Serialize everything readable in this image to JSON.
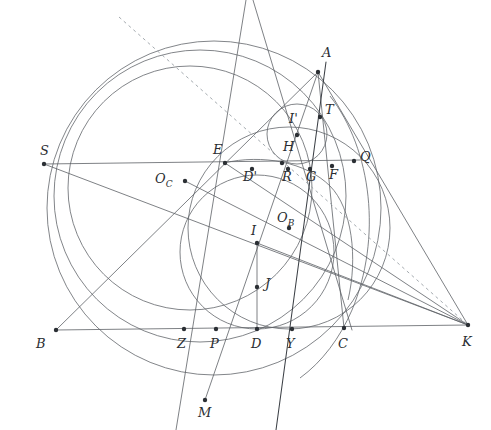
{
  "figure": {
    "width": 491,
    "height": 430,
    "background": "#ffffff",
    "stroke_color": "#62666b",
    "accent_stroke": "#3c4046",
    "dashed_color": "#9aa0a6",
    "label_color": "#2a2d31"
  },
  "points": [
    {
      "id": "A",
      "label": "A",
      "x": 318,
      "y": 72,
      "lx": 322,
      "ly": 48,
      "dot": true
    },
    {
      "id": "B",
      "label": "B",
      "x": 56,
      "y": 330,
      "lx": 37,
      "ly": 339,
      "dot": true
    },
    {
      "id": "C",
      "label": "C",
      "x": 344,
      "y": 328,
      "lx": 338,
      "ly": 339,
      "dot": true
    },
    {
      "id": "K",
      "label": "K",
      "x": 468,
      "y": 325,
      "lx": 462,
      "ly": 338,
      "dot": true
    },
    {
      "id": "S",
      "label": "S",
      "x": 44,
      "y": 164,
      "lx": 40,
      "ly": 146,
      "dot": true
    },
    {
      "id": "E",
      "label": "E",
      "x": 225,
      "y": 163,
      "lx": 215,
      "ly": 145,
      "dot": true
    },
    {
      "id": "Q",
      "label": "Q",
      "x": 354,
      "y": 161,
      "lx": 359,
      "ly": 152,
      "dot": true
    },
    {
      "id": "T",
      "label": "T",
      "x": 320,
      "y": 117,
      "lx": 326,
      "ly": 105,
      "dot": true
    },
    {
      "id": "Iprime",
      "label": "I'",
      "x": 297,
      "y": 135,
      "lx": 290,
      "ly": 114,
      "dot": true
    },
    {
      "id": "H",
      "label": "H",
      "x": 282,
      "y": 163,
      "lx": 284,
      "ly": 143,
      "dot": true
    },
    {
      "id": "Dprime",
      "label": "D'",
      "x": 252,
      "y": 170,
      "lx": 246,
      "ly": 172,
      "dot": true
    },
    {
      "id": "R",
      "label": "R",
      "x": 288,
      "y": 170,
      "lx": 283,
      "ly": 172,
      "dot": true
    },
    {
      "id": "G",
      "label": "G",
      "x": 310,
      "y": 170,
      "lx": 307,
      "ly": 172,
      "dot": true
    },
    {
      "id": "F",
      "label": "F",
      "x": 332,
      "y": 167,
      "lx": 330,
      "ly": 172,
      "dot": true
    },
    {
      "id": "OC",
      "label": "O_C",
      "x": 185,
      "y": 181,
      "lx": 155,
      "ly": 174,
      "dot": true
    },
    {
      "id": "OB",
      "label": "O_B",
      "x": 289,
      "y": 228,
      "lx": 278,
      "ly": 213,
      "dot": true
    },
    {
      "id": "I",
      "label": "I",
      "x": 257,
      "y": 243,
      "lx": 251,
      "ly": 226,
      "dot": true
    },
    {
      "id": "J",
      "label": "J",
      "x": 257,
      "y": 287,
      "lx": 265,
      "ly": 279,
      "dot": true
    },
    {
      "id": "Z",
      "label": "Z",
      "x": 184,
      "y": 329,
      "lx": 177,
      "ly": 339,
      "dot": true
    },
    {
      "id": "P",
      "label": "P",
      "x": 216,
      "y": 329,
      "lx": 210,
      "ly": 339,
      "dot": true
    },
    {
      "id": "D",
      "label": "D",
      "x": 257,
      "y": 329,
      "lx": 251,
      "ly": 339,
      "dot": true
    },
    {
      "id": "Y",
      "label": "Y",
      "x": 292,
      "y": 329,
      "lx": 286,
      "ly": 339,
      "dot": true
    },
    {
      "id": "M",
      "label": "M",
      "x": 205,
      "y": 400,
      "lx": 198,
      "ly": 408,
      "dot": true
    }
  ],
  "circles": [
    {
      "id": "circumcircle",
      "cx": 201,
      "cy": 198,
      "r": 146,
      "note": "circumcircle of triangle ABC through A, B, C, M"
    },
    {
      "id": "outer-arc-circle",
      "cx": 214,
      "cy": 208,
      "r": 165,
      "note": "large outer circle through S and B region"
    },
    {
      "id": "incircle",
      "cx": 257,
      "cy": 253,
      "r": 77,
      "note": "incircle tangent to BC at D"
    },
    {
      "id": "mixtilinear-small",
      "cx": 297,
      "cy": 134,
      "r": 30,
      "note": "small circle centered at I' tangent at T"
    },
    {
      "id": "circle-OB",
      "cx": 289,
      "cy": 228,
      "r": 102,
      "note": "circle centered O_B through Q and Y"
    },
    {
      "id": "circle-OC",
      "cx": 185,
      "cy": 181,
      "r": 150,
      "note": "circle centered O_C through E and P"
    }
  ],
  "segments": [
    {
      "id": "BC",
      "from": "B",
      "to": "K",
      "style": "plain"
    },
    {
      "id": "AB",
      "from": "A",
      "to": "B",
      "style": "plain"
    },
    {
      "id": "AC",
      "from": "A",
      "to": "C",
      "style": "plain"
    },
    {
      "id": "SQ",
      "from": "S",
      "to": "Q",
      "style": "plain"
    },
    {
      "id": "SK",
      "from": "S",
      "to": "K",
      "style": "plain"
    },
    {
      "id": "AK",
      "from": "A",
      "to": "K",
      "style": "plain"
    },
    {
      "id": "EK",
      "from": "E",
      "to": "K",
      "style": "plain"
    },
    {
      "id": "TK",
      "from": "T",
      "to": "K",
      "style": "plain"
    },
    {
      "id": "ID",
      "from": "I",
      "to": "D",
      "style": "plain"
    },
    {
      "id": "AM",
      "from": "A",
      "to": "M",
      "style": "plain"
    },
    {
      "id": "OCF",
      "from": "OC",
      "to": "F",
      "style": "plain"
    },
    {
      "id": "TM",
      "from": "T",
      "to": "M",
      "style": "dark"
    },
    {
      "id": "dashed-K",
      "from": "dash-start",
      "to": "K",
      "style": "dashed"
    }
  ],
  "labels": {
    "A": "A",
    "B": "B",
    "C": "C",
    "K": "K",
    "S": "S",
    "E": "E",
    "Q": "Q",
    "T": "T",
    "Iprime": "I'",
    "H": "H",
    "Dprime": "D'",
    "R": "R",
    "G": "G",
    "F": "F",
    "OC_base": "O",
    "OC_sub": "C",
    "OB_base": "O",
    "OB_sub": "B",
    "I": "I",
    "J": "J",
    "Z": "Z",
    "P": "P",
    "D": "D",
    "Y": "Y",
    "M": "M"
  }
}
